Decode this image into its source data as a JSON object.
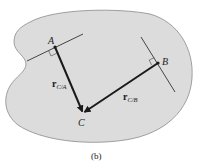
{
  "figure": {
    "caption": "(b)",
    "colors": {
      "body_fill": "#dcdcdc",
      "body_stroke": "#8a8a8a",
      "vector": "#1a1a1a",
      "line": "#333333"
    },
    "points": {
      "A": {
        "label": "A"
      },
      "B": {
        "label": "B"
      },
      "C": {
        "label": "C"
      }
    },
    "vectors": [
      {
        "symbol": "r",
        "subscript": "C/A",
        "from": "A",
        "to": "C"
      },
      {
        "symbol": "r",
        "subscript": "C/B",
        "from": "B",
        "to": "C"
      }
    ],
    "tangent_lines": [
      {
        "through": "A",
        "right_angle_marker": true
      },
      {
        "through": "B",
        "right_angle_marker": true
      }
    ]
  }
}
